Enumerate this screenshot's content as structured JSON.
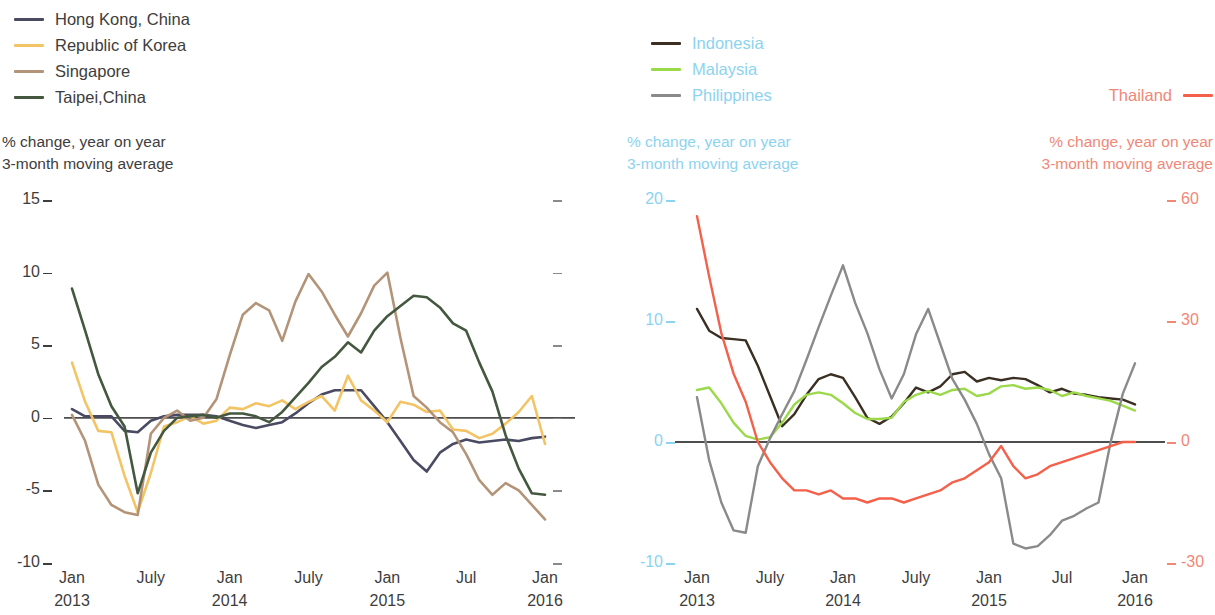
{
  "panels": [
    {
      "id": "left",
      "legend": [
        {
          "label": "Hong Kong, China",
          "color": "#4a4a63",
          "text_color": "#3d3d3d"
        },
        {
          "label": "Republic of Korea",
          "color": "#f3c465",
          "text_color": "#3d3d3d"
        },
        {
          "label": "Singapore",
          "color": "#b39478",
          "text_color": "#3d3d3d"
        },
        {
          "label": "Taipei,China",
          "color": "#44573f",
          "text_color": "#3d3d3d"
        }
      ],
      "caption_left": "% change, year on year\n3-month moving average",
      "caption_left_color": "#3d3d3d"
    },
    {
      "id": "right",
      "legend": [
        {
          "label": "Indonesia",
          "color": "#3b2f23",
          "text_color": "#8cd3ef"
        },
        {
          "label": "Malaysia",
          "color": "#9bd94a",
          "text_color": "#8cd3ef"
        },
        {
          "label": "Philippines",
          "color": "#8a8a8a",
          "text_color": "#8cd3ef"
        }
      ],
      "legend_right": [
        {
          "label": "Thailand",
          "color": "#f4604a",
          "text_color": "#f08878"
        }
      ],
      "caption_left": "% change, year on year\n3-month moving average",
      "caption_left_color": "#8cd3ef",
      "caption_right": "% change, year on year\n3-month moving average",
      "caption_right_color": "#f08878"
    }
  ],
  "chart_data": [
    {
      "type": "line",
      "title": "",
      "xlabel": "",
      "ylabel": "% change, year on year 3-month moving average",
      "ylim": [
        -10,
        15
      ],
      "yticks": [
        15,
        10,
        5,
        0,
        -5,
        -10
      ],
      "ytick_labels": [
        "15",
        "10",
        "5",
        "0",
        "-5",
        "-10"
      ],
      "grid": false,
      "legend_position": "top-left",
      "x": [
        "Jan 2013",
        "Feb 2013",
        "Mar 2013",
        "Apr 2013",
        "May 2013",
        "Jun 2013",
        "Jul 2013",
        "Aug 2013",
        "Sep 2013",
        "Oct 2013",
        "Nov 2013",
        "Dec 2013",
        "Jan 2014",
        "Feb 2014",
        "Mar 2014",
        "Apr 2014",
        "May 2014",
        "Jun 2014",
        "Jul 2014",
        "Aug 2014",
        "Sep 2014",
        "Oct 2014",
        "Nov 2014",
        "Dec 2014",
        "Jan 2015",
        "Feb 2015",
        "Mar 2015",
        "Apr 2015",
        "May 2015",
        "Jun 2015",
        "Jul 2015",
        "Aug 2015",
        "Sep 2015",
        "Oct 2015",
        "Nov 2015",
        "Dec 2015",
        "Jan 2016"
      ],
      "xtick_positions": [
        0,
        6,
        12,
        18,
        24,
        30,
        36
      ],
      "xtick_labels": [
        "Jan\n2013",
        "July",
        "Jan\n2014",
        "July",
        "Jan\n2015",
        "Jul",
        "Jan\n2016"
      ],
      "series": [
        {
          "name": "Hong Kong, China",
          "color": "#4a4a63",
          "values": [
            0.6,
            0.1,
            0.1,
            0.1,
            -0.9,
            -1.0,
            -0.2,
            0.1,
            0.2,
            0.2,
            0.2,
            0.1,
            -0.2,
            -0.5,
            -0.7,
            -0.5,
            -0.3,
            0.3,
            1.0,
            1.6,
            1.9,
            1.9,
            1.9,
            0.8,
            -0.3,
            -1.6,
            -2.9,
            -3.7,
            -2.4,
            -1.8,
            -1.5,
            -1.7,
            -1.6,
            -1.5,
            -1.6,
            -1.4,
            -1.3
          ]
        },
        {
          "name": "Republic of Korea",
          "color": "#f3c465",
          "values": [
            3.8,
            1.1,
            -0.9,
            -1.0,
            -4.0,
            -6.5,
            -3.8,
            -0.6,
            -0.3,
            0.1,
            -0.4,
            -0.2,
            0.7,
            0.6,
            1.0,
            0.8,
            1.2,
            0.6,
            1.1,
            1.5,
            0.5,
            2.9,
            1.2,
            0.5,
            -0.3,
            1.1,
            0.9,
            0.4,
            0.5,
            -0.8,
            -0.9,
            -1.4,
            -1.1,
            -0.4,
            0.4,
            1.5,
            -1.8
          ]
        },
        {
          "name": "Singapore",
          "color": "#b39478",
          "values": [
            0.2,
            -1.6,
            -4.6,
            -6.0,
            -6.5,
            -6.7,
            -1.1,
            0.0,
            0.5,
            -0.2,
            0.0,
            1.3,
            4.3,
            7.1,
            7.9,
            7.4,
            5.3,
            8.0,
            9.9,
            8.7,
            7.1,
            5.6,
            7.2,
            9.1,
            10.0,
            5.5,
            1.5,
            0.7,
            -0.3,
            -1.0,
            -2.5,
            -4.3,
            -5.3,
            -4.5,
            -5.0,
            -6.0,
            -7.0
          ]
        },
        {
          "name": "Taipei,China",
          "color": "#44573f",
          "values": [
            8.9,
            6.0,
            3.0,
            0.8,
            -0.6,
            -5.2,
            -2.4,
            -0.9,
            0.0,
            0.1,
            0.2,
            0.0,
            0.3,
            0.3,
            0.1,
            -0.3,
            0.4,
            1.4,
            2.4,
            3.5,
            4.2,
            5.2,
            4.5,
            6.0,
            7.0,
            7.7,
            8.4,
            8.3,
            7.6,
            6.5,
            6.0,
            3.8,
            1.8,
            -1.2,
            -3.5,
            -5.2,
            -5.3
          ]
        }
      ]
    },
    {
      "type": "line",
      "title": "",
      "xlabel": "",
      "ylabel_left": "% change, year on year 3-month moving average",
      "ylabel_right": "% change, year on year 3-month moving average",
      "ylim_left": [
        -10,
        20
      ],
      "yticks_left": [
        20,
        10,
        0,
        -10
      ],
      "ytick_labels_left": [
        "20",
        "10",
        "0",
        "-10"
      ],
      "ylim_right": [
        -30,
        60
      ],
      "yticks_right": [
        60,
        30,
        0,
        -30
      ],
      "ytick_labels_right": [
        "60",
        "30",
        "0",
        "-30"
      ],
      "grid": false,
      "legend_position": "top",
      "x": [
        "Jan 2013",
        "Feb 2013",
        "Mar 2013",
        "Apr 2013",
        "May 2013",
        "Jun 2013",
        "Jul 2013",
        "Aug 2013",
        "Sep 2013",
        "Oct 2013",
        "Nov 2013",
        "Dec 2013",
        "Jan 2014",
        "Feb 2014",
        "Mar 2014",
        "Apr 2014",
        "May 2014",
        "Jun 2014",
        "Jul 2014",
        "Aug 2014",
        "Sep 2014",
        "Oct 2014",
        "Nov 2014",
        "Dec 2014",
        "Jan 2015",
        "Feb 2015",
        "Mar 2015",
        "Apr 2015",
        "May 2015",
        "Jun 2015",
        "Jul 2015",
        "Aug 2015",
        "Sep 2015",
        "Oct 2015",
        "Nov 2015",
        "Dec 2015",
        "Jan 2016"
      ],
      "xtick_positions": [
        0,
        6,
        12,
        18,
        24,
        30,
        36
      ],
      "xtick_labels": [
        "Jan\n2013",
        "July",
        "Jan\n2014",
        "July",
        "Jan\n2015",
        "Jul",
        "Jan\n2016"
      ],
      "series": [
        {
          "name": "Indonesia",
          "color": "#3b2f23",
          "axis": "left",
          "values": [
            11.0,
            9.2,
            8.6,
            8.5,
            8.4,
            6.3,
            3.8,
            1.3,
            2.3,
            3.9,
            5.2,
            5.6,
            5.3,
            3.7,
            2.0,
            1.5,
            2.1,
            3.2,
            4.5,
            4.1,
            4.6,
            5.6,
            5.8,
            5.0,
            5.3,
            5.1,
            5.3,
            5.2,
            4.7,
            4.1,
            4.4,
            4.0,
            3.9,
            3.7,
            3.6,
            3.5,
            3.1
          ]
        },
        {
          "name": "Malaysia",
          "color": "#9bd94a",
          "axis": "left",
          "values": [
            4.3,
            4.5,
            3.2,
            1.6,
            0.5,
            0.2,
            0.4,
            1.6,
            3.1,
            3.9,
            4.1,
            3.9,
            3.2,
            2.4,
            1.9,
            1.9,
            2.0,
            3.3,
            3.9,
            4.2,
            3.9,
            4.3,
            4.4,
            3.8,
            4.0,
            4.6,
            4.7,
            4.4,
            4.5,
            4.3,
            3.8,
            4.1,
            3.8,
            3.6,
            3.4,
            3.0,
            2.6
          ]
        },
        {
          "name": "Philippines",
          "color": "#8a8a8a",
          "axis": "left",
          "values": [
            3.7,
            -1.5,
            -5.0,
            -7.3,
            -7.5,
            -2.0,
            0.3,
            2.3,
            4.2,
            6.8,
            9.5,
            12.1,
            14.6,
            11.5,
            9.0,
            6.0,
            3.6,
            5.6,
            8.9,
            11.0,
            8.1,
            5.2,
            3.5,
            1.5,
            -1.0,
            -3.0,
            -8.4,
            -8.8,
            -8.6,
            -7.7,
            -6.5,
            -6.1,
            -5.5,
            -5.0,
            0.0,
            4.0,
            6.5
          ]
        },
        {
          "name": "Thailand",
          "color": "#f4604a",
          "axis": "right",
          "values": [
            56,
            41,
            27,
            17,
            10,
            0,
            -5,
            -9,
            -12,
            -12,
            -13,
            -12,
            -14,
            -14,
            -15,
            -14,
            -14,
            -15,
            -14,
            -13,
            -12,
            -10,
            -9,
            -7,
            -5,
            -1,
            -6,
            -9,
            -8,
            -6,
            -5,
            -4,
            -3,
            -2,
            -1,
            0,
            0
          ]
        }
      ]
    }
  ]
}
